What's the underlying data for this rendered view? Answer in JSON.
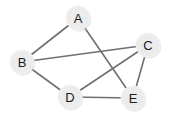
{
  "figure": {
    "background_color": "#ffffff",
    "width": 177,
    "height": 124
  },
  "style": {
    "node_fill": "#ececec",
    "node_stroke": "#f4f4f4",
    "node_shadow": "#d6d6d6",
    "node_radius": 12,
    "label_color": "#1c1c1c",
    "edge_color": "#707070",
    "edge_width": 1.6
  },
  "graph_data": {
    "type": "node-link-diagram",
    "directed": false,
    "node_count": 5,
    "edge_count": 7,
    "nodes": [
      {
        "id": "A",
        "label": "A",
        "x": 78,
        "y": 18,
        "degree": 2
      },
      {
        "id": "B",
        "label": "B",
        "x": 22,
        "y": 62,
        "degree": 3
      },
      {
        "id": "C",
        "label": "C",
        "x": 148,
        "y": 45,
        "degree": 3
      },
      {
        "id": "D",
        "label": "D",
        "x": 70,
        "y": 97,
        "degree": 3
      },
      {
        "id": "E",
        "label": "E",
        "x": 133,
        "y": 98,
        "degree": 3
      }
    ],
    "edges": [
      {
        "id": "A-B",
        "source": "A",
        "target": "B",
        "x1": 78,
        "y1": 18,
        "x2": 22,
        "y2": 62
      },
      {
        "id": "A-E",
        "source": "A",
        "target": "E",
        "x1": 78,
        "y1": 18,
        "x2": 133,
        "y2": 98
      },
      {
        "id": "B-C",
        "source": "B",
        "target": "C",
        "x1": 22,
        "y1": 62,
        "x2": 148,
        "y2": 45
      },
      {
        "id": "B-D",
        "source": "B",
        "target": "D",
        "x1": 22,
        "y1": 62,
        "x2": 70,
        "y2": 97
      },
      {
        "id": "C-D",
        "source": "C",
        "target": "D",
        "x1": 148,
        "y1": 45,
        "x2": 70,
        "y2": 97
      },
      {
        "id": "C-E",
        "source": "C",
        "target": "E",
        "x1": 148,
        "y1": 45,
        "x2": 133,
        "y2": 98
      },
      {
        "id": "D-E",
        "source": "D",
        "target": "E",
        "x1": 70,
        "y1": 97,
        "x2": 133,
        "y2": 98
      }
    ],
    "adjacency": {
      "A": [
        "B",
        "E"
      ],
      "B": [
        "A",
        "C",
        "D"
      ],
      "C": [
        "B",
        "D",
        "E"
      ],
      "D": [
        "B",
        "C",
        "E"
      ],
      "E": [
        "A",
        "C",
        "D"
      ]
    }
  }
}
